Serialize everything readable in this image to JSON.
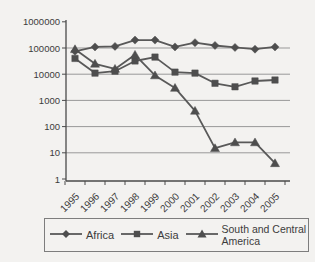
{
  "page": {
    "background": "#f3f2f0"
  },
  "chart_data": {
    "type": "line",
    "title": "",
    "xlabel": "",
    "ylabel": "",
    "y_scale": "log",
    "ylim": [
      1,
      1000000
    ],
    "y_tick_labels": [
      "1000000",
      "100000",
      "10000",
      "1000",
      "100",
      "10",
      "1"
    ],
    "y_tick_values": [
      1000000,
      100000,
      10000,
      1000,
      100,
      10,
      1
    ],
    "grid": "horizontal",
    "legend_position": "bottom",
    "categories": [
      "1995",
      "1996",
      "1997",
      "1998",
      "1999",
      "2000",
      "2001",
      "2002",
      "2003",
      "2004",
      "2005"
    ],
    "series": [
      {
        "name": "Africa",
        "marker": "diamond",
        "color": "#595959",
        "values": [
          75000,
          110000,
          115000,
          200000,
          200000,
          110000,
          160000,
          125000,
          105000,
          90000,
          110000
        ]
      },
      {
        "name": "Asia",
        "marker": "square",
        "color": "#595959",
        "values": [
          40000,
          11000,
          13000,
          32000,
          45000,
          12000,
          11000,
          4500,
          3300,
          5500,
          6000
        ]
      },
      {
        "name": "South and Central America",
        "marker": "triangle",
        "color": "#595959",
        "values": [
          90000,
          25000,
          16000,
          55000,
          9000,
          3000,
          400,
          15,
          25,
          25,
          4
        ]
      }
    ],
    "colors": {
      "line": "#595959",
      "marker": "#4e4e4e",
      "grid": "#999999",
      "axis": "#4a4a4a",
      "text": "#3c3c3c",
      "legend_border": "#7d7d7d"
    }
  },
  "legend": {
    "items": [
      {
        "label": "Africa"
      },
      {
        "label": "Asia"
      },
      {
        "label": "South and Central America"
      }
    ]
  }
}
